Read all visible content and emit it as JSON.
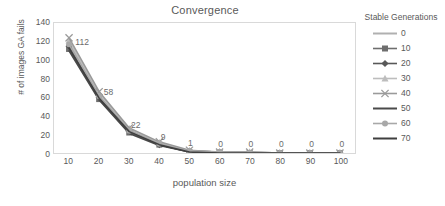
{
  "chart_data": {
    "type": "line",
    "title": "Convergence",
    "xlabel": "population size",
    "ylabel": "# of images GA fails",
    "x": [
      10,
      20,
      30,
      40,
      50,
      60,
      70,
      80,
      90,
      100
    ],
    "xticks": [
      "10",
      "20",
      "30",
      "40",
      "50",
      "60",
      "70",
      "80",
      "90",
      "100"
    ],
    "yticks": [
      "0",
      "20",
      "40",
      "60",
      "80",
      "100",
      "120",
      "140"
    ],
    "xlim": [
      5,
      105
    ],
    "ylim": [
      0,
      140
    ],
    "grid": false,
    "legend_position": "right",
    "legend_title": "Stable Generations",
    "data_labels": [
      "112",
      "58",
      "22",
      "9",
      "1",
      "0",
      "0",
      "0",
      "0",
      "0"
    ],
    "series": [
      {
        "name": "0",
        "color": "#b0b0b0",
        "marker": "none",
        "values": [
          119,
          62,
          25,
          10,
          2,
          1,
          1,
          0,
          0,
          0
        ]
      },
      {
        "name": "10",
        "color": "#6e6e6e",
        "marker": "square",
        "values": [
          112,
          58,
          22,
          9,
          1,
          0,
          0,
          0,
          0,
          0
        ]
      },
      {
        "name": "20",
        "color": "#585858",
        "marker": "diamond",
        "values": [
          115,
          60,
          24,
          9,
          2,
          1,
          0,
          0,
          0,
          0
        ]
      },
      {
        "name": "30",
        "color": "#bdbdbd",
        "marker": "triangle",
        "values": [
          121,
          64,
          26,
          11,
          2,
          1,
          1,
          0,
          0,
          0
        ]
      },
      {
        "name": "40",
        "color": "#9a9a9a",
        "marker": "cross",
        "values": [
          124,
          66,
          27,
          12,
          3,
          1,
          1,
          0,
          0,
          0
        ]
      },
      {
        "name": "50",
        "color": "#4a4a4a",
        "marker": "none",
        "values": [
          110,
          57,
          21,
          8,
          1,
          0,
          0,
          0,
          0,
          0
        ]
      },
      {
        "name": "60",
        "color": "#a8a8a8",
        "marker": "circle",
        "values": [
          117,
          61,
          24,
          10,
          2,
          1,
          0,
          0,
          0,
          0
        ]
      },
      {
        "name": "70",
        "color": "#3f3f3f",
        "marker": "none",
        "values": [
          113,
          59,
          23,
          9,
          1,
          0,
          0,
          0,
          0,
          0
        ]
      }
    ]
  }
}
